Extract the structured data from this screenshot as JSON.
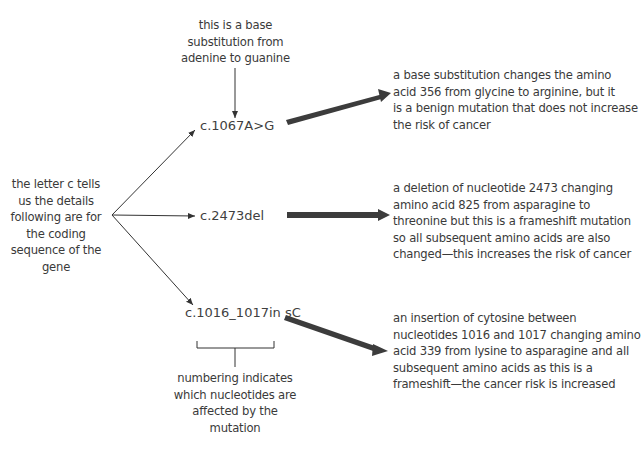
{
  "diagram": {
    "top_note": [
      "this is a base",
      "substitution from",
      "adenine to guanine"
    ],
    "left_note": [
      "the letter c tells",
      "us the details",
      "following are for",
      "the coding",
      "sequence of the",
      "gene"
    ],
    "bottom_note": [
      "numbering indicates",
      "which nucleotides are",
      "affected by the",
      "mutation"
    ],
    "mutations": [
      {
        "code": "c.1067A>G",
        "description": [
          "a base substitution changes the amino",
          "acid 356 from glycine to arginine, but it",
          "is a benign mutation that does not increase",
          "the risk of cancer"
        ]
      },
      {
        "code": "c.2473del",
        "description": [
          "a deletion of nucleotide 2473 changing",
          "amino acid 825 from asparagine to",
          "threonine but this is a frameshift mutation",
          "so all subsequent amino acids are also",
          "changed—this increases the risk of cancer"
        ]
      },
      {
        "code": "c.1016_1017in sC",
        "description": [
          "an insertion of cytosine between",
          "nucleotides 1016 and 1017 changing amino",
          "acid 339 from lysine to asparagine and all",
          "subsequent amino acids as this is a",
          "frameshift—the cancer risk is increased"
        ]
      }
    ],
    "colors": {
      "text": "#3a3a3a",
      "thin_arrow": "#333333",
      "thick_arrow": "#3c3c3c"
    }
  }
}
